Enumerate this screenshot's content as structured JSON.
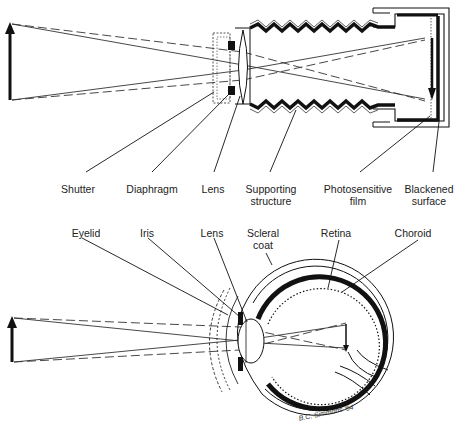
{
  "figure": {
    "camera": {
      "labels": [
        {
          "id": "shutter",
          "line1": "Shutter",
          "line2": "",
          "x": 78,
          "y": 183
        },
        {
          "id": "diaphragm",
          "line1": "Diaphragm",
          "line2": "",
          "x": 152,
          "y": 183
        },
        {
          "id": "lens",
          "line1": "Lens",
          "line2": "",
          "x": 213,
          "y": 183
        },
        {
          "id": "supporting-structure",
          "line1": "Supporting",
          "line2": "structure",
          "x": 271,
          "y": 183
        },
        {
          "id": "photosensitive-film",
          "line1": "Photosensitive",
          "line2": "film",
          "x": 358,
          "y": 183
        },
        {
          "id": "blackened-surface",
          "line1": "Blackened",
          "line2": "surface",
          "x": 429,
          "y": 183
        }
      ]
    },
    "eye": {
      "labels": [
        {
          "id": "eyelid",
          "line1": "Eyelid",
          "line2": "",
          "x": 86,
          "y": 227
        },
        {
          "id": "iris",
          "line1": "Iris",
          "line2": "",
          "x": 147,
          "y": 227
        },
        {
          "id": "lens",
          "line1": "Lens",
          "line2": "",
          "x": 212,
          "y": 227
        },
        {
          "id": "scleral-coat",
          "line1": "Scleral",
          "line2": "coat",
          "x": 263,
          "y": 227
        },
        {
          "id": "retina",
          "line1": "Retina",
          "line2": "",
          "x": 336,
          "y": 227
        },
        {
          "id": "choroid",
          "line1": "Choroid",
          "line2": "",
          "x": 413,
          "y": 227
        }
      ]
    },
    "signature": "B.C. Simmons '64",
    "colors": {
      "ink": "#111111",
      "background": "#ffffff"
    }
  }
}
